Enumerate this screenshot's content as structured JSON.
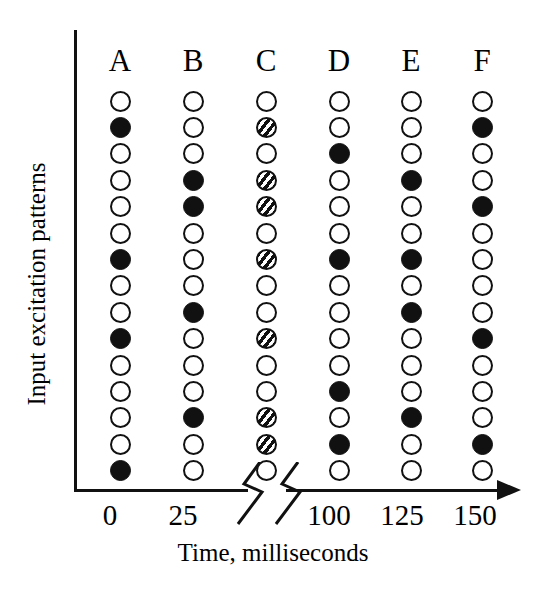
{
  "figure": {
    "y_axis_title": "Input excitation patterns",
    "x_axis_title": "Time, milliseconds"
  },
  "chart_data": {
    "type": "scatter",
    "title": "",
    "xlabel": "Time, milliseconds",
    "ylabel": "Input excitation patterns",
    "grid": false,
    "legend": "none",
    "x_tick_labels": [
      "0",
      "25",
      "100",
      "125",
      "150"
    ],
    "x_tick_values": [
      0,
      25,
      100,
      125,
      150
    ],
    "axis_break": true,
    "axis_break_between": [
      25,
      100
    ],
    "column_labels": [
      "A",
      "B",
      "C",
      "D",
      "E",
      "F"
    ],
    "rows": 15,
    "marker_states": [
      "open",
      "filled",
      "hatched"
    ],
    "marker_state_meaning": {
      "open": "inactive unit",
      "filled": "active unit",
      "hatched": "partially active unit"
    },
    "columns": [
      {
        "label": "A",
        "x_value": 0,
        "markers": [
          "open",
          "filled",
          "open",
          "open",
          "open",
          "open",
          "filled",
          "open",
          "open",
          "filled",
          "open",
          "open",
          "open",
          "open",
          "filled"
        ],
        "active_rows": [
          2,
          7,
          10,
          15
        ],
        "hatched_rows": []
      },
      {
        "label": "B",
        "x_value": 25,
        "markers": [
          "open",
          "open",
          "open",
          "filled",
          "filled",
          "open",
          "open",
          "open",
          "filled",
          "open",
          "open",
          "open",
          "filled",
          "open",
          "open"
        ],
        "active_rows": [
          4,
          5,
          9,
          13
        ],
        "hatched_rows": []
      },
      {
        "label": "C",
        "x_value": 50,
        "markers": [
          "open",
          "hatched",
          "open",
          "hatched",
          "hatched",
          "open",
          "hatched",
          "open",
          "open",
          "hatched",
          "open",
          "open",
          "hatched",
          "hatched",
          "open"
        ],
        "active_rows": [],
        "hatched_rows": [
          2,
          4,
          5,
          7,
          10,
          13,
          14
        ]
      },
      {
        "label": "D",
        "x_value": 100,
        "markers": [
          "open",
          "open",
          "filled",
          "open",
          "open",
          "open",
          "filled",
          "open",
          "open",
          "open",
          "open",
          "filled",
          "open",
          "filled",
          "open"
        ],
        "active_rows": [
          3,
          7,
          12,
          14
        ],
        "hatched_rows": []
      },
      {
        "label": "E",
        "x_value": 125,
        "markers": [
          "open",
          "open",
          "open",
          "filled",
          "open",
          "open",
          "filled",
          "open",
          "filled",
          "open",
          "open",
          "open",
          "filled",
          "open",
          "open"
        ],
        "active_rows": [
          4,
          7,
          9,
          13
        ],
        "hatched_rows": []
      },
      {
        "label": "F",
        "x_value": 150,
        "markers": [
          "open",
          "filled",
          "open",
          "open",
          "filled",
          "open",
          "open",
          "open",
          "open",
          "filled",
          "open",
          "open",
          "open",
          "filled",
          "open"
        ],
        "active_rows": [
          2,
          5,
          10,
          14
        ],
        "hatched_rows": []
      }
    ]
  },
  "layout": {
    "column_x": [
      90,
      163,
      236,
      309,
      381,
      452
    ],
    "tick_x": [
      72,
      145,
      291,
      364,
      437
    ]
  },
  "colors": {
    "ink": "#111111",
    "background": "#ffffff"
  }
}
